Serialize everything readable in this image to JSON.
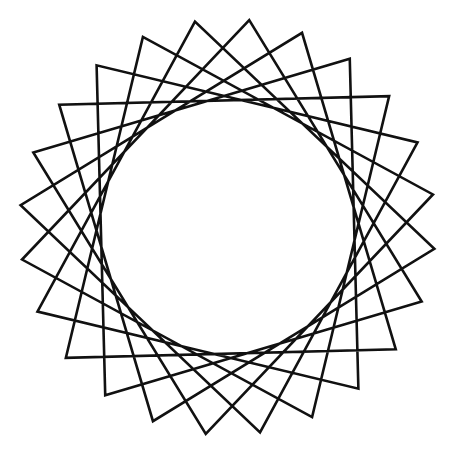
{
  "figure": {
    "type": "star-polygon",
    "points": 24,
    "step": 7,
    "center": [
      227.5,
      227
    ],
    "outer_radius": 208,
    "start_angle_deg": -84,
    "stroke_color": "#111111",
    "stroke_width": 2.6,
    "background": "#ffffff"
  }
}
